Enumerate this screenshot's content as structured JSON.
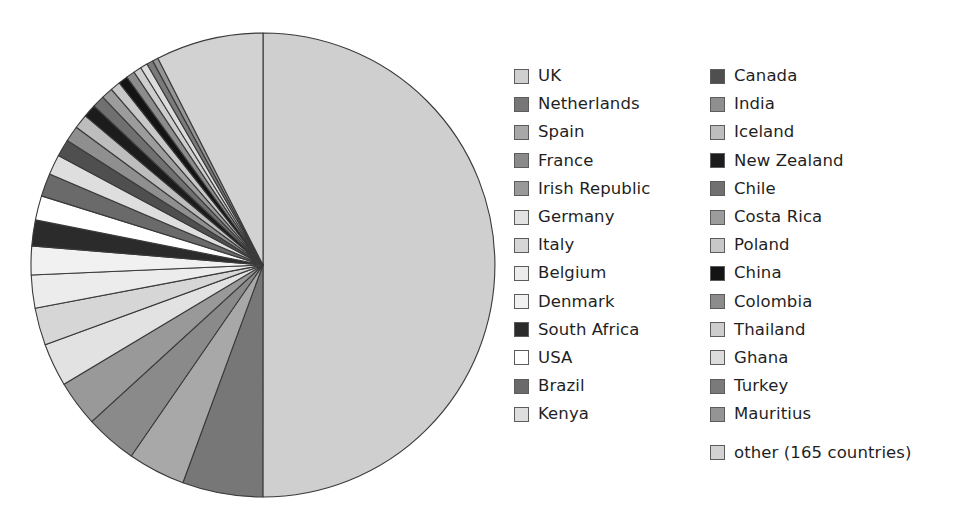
{
  "chart_data": {
    "type": "pie",
    "title": "",
    "subtitle": "",
    "xlabel": "",
    "ylabel": "",
    "grid": false,
    "legend_position": "right",
    "legend_columns": 2,
    "start_angle_deg": 0,
    "direction": "clockwise",
    "categories": [
      "UK",
      "Netherlands",
      "Spain",
      "France",
      "Irish Republic",
      "Germany",
      "Italy",
      "Belgium",
      "Denmark",
      "South Africa",
      "USA",
      "Brazil",
      "Kenya",
      "Canada",
      "India",
      "Iceland",
      "New Zealand",
      "Chile",
      "Costa Rica",
      "Poland",
      "China",
      "Colombia",
      "Thailand",
      "Ghana",
      "Turkey",
      "Mauritius",
      "other (165 countries)"
    ],
    "values": [
      50.0,
      5.6,
      4.0,
      3.6,
      3.2,
      3.0,
      2.6,
      2.3,
      2.0,
      1.8,
      1.7,
      1.6,
      1.4,
      1.2,
      1.1,
      1.0,
      0.9,
      0.85,
      0.8,
      0.7,
      0.65,
      0.6,
      0.55,
      0.5,
      0.45,
      0.4,
      7.48
    ],
    "colors": [
      "#cfcfcf",
      "#777777",
      "#a8a8a8",
      "#8a8a8a",
      "#999999",
      "#e2e2e2",
      "#d6d6d6",
      "#ececec",
      "#f1f1f1",
      "#2b2b2b",
      "#ffffff",
      "#6a6a6a",
      "#dedede",
      "#4f4f4f",
      "#8f8f8f",
      "#bdbdbd",
      "#1c1c1c",
      "#707070",
      "#9c9c9c",
      "#c8c8c8",
      "#141414",
      "#8c8c8c",
      "#cdcdcd",
      "#dcdcdc",
      "#7a7a7a",
      "#949494",
      "#d2d2d2"
    ]
  },
  "legend": {
    "columns": [
      {
        "items": [
          {
            "label": "UK",
            "color": "#cfcfcf"
          },
          {
            "label": "Netherlands",
            "color": "#777777"
          },
          {
            "label": "Spain",
            "color": "#a8a8a8"
          },
          {
            "label": "France",
            "color": "#8a8a8a"
          },
          {
            "label": "Irish Republic",
            "color": "#999999"
          },
          {
            "label": "Germany",
            "color": "#e2e2e2"
          },
          {
            "label": "Italy",
            "color": "#d6d6d6"
          },
          {
            "label": "Belgium",
            "color": "#ececec"
          },
          {
            "label": "Denmark",
            "color": "#f1f1f1"
          },
          {
            "label": "South Africa",
            "color": "#2b2b2b"
          },
          {
            "label": "USA",
            "color": "#ffffff"
          },
          {
            "label": "Brazil",
            "color": "#6a6a6a"
          },
          {
            "label": "Kenya",
            "color": "#dedede"
          }
        ]
      },
      {
        "items": [
          {
            "label": "Canada",
            "color": "#4f4f4f"
          },
          {
            "label": "India",
            "color": "#8f8f8f"
          },
          {
            "label": "Iceland",
            "color": "#bdbdbd"
          },
          {
            "label": "New Zealand",
            "color": "#1c1c1c"
          },
          {
            "label": "Chile",
            "color": "#707070"
          },
          {
            "label": "Costa Rica",
            "color": "#9c9c9c"
          },
          {
            "label": "Poland",
            "color": "#c8c8c8"
          },
          {
            "label": "China",
            "color": "#141414"
          },
          {
            "label": "Colombia",
            "color": "#8c8c8c"
          },
          {
            "label": "Thailand",
            "color": "#cdcdcd"
          },
          {
            "label": "Ghana",
            "color": "#dcdcdc"
          },
          {
            "label": "Turkey",
            "color": "#7a7a7a"
          },
          {
            "label": "Mauritius",
            "color": "#949494"
          },
          {
            "label": "other (165 countries)",
            "color": "#d2d2d2"
          }
        ]
      }
    ]
  },
  "pie_geometry": {
    "center_x": 263,
    "center_y": 265,
    "radius": 232,
    "stroke": "#3a3a3a",
    "stroke_width": 1.1
  }
}
